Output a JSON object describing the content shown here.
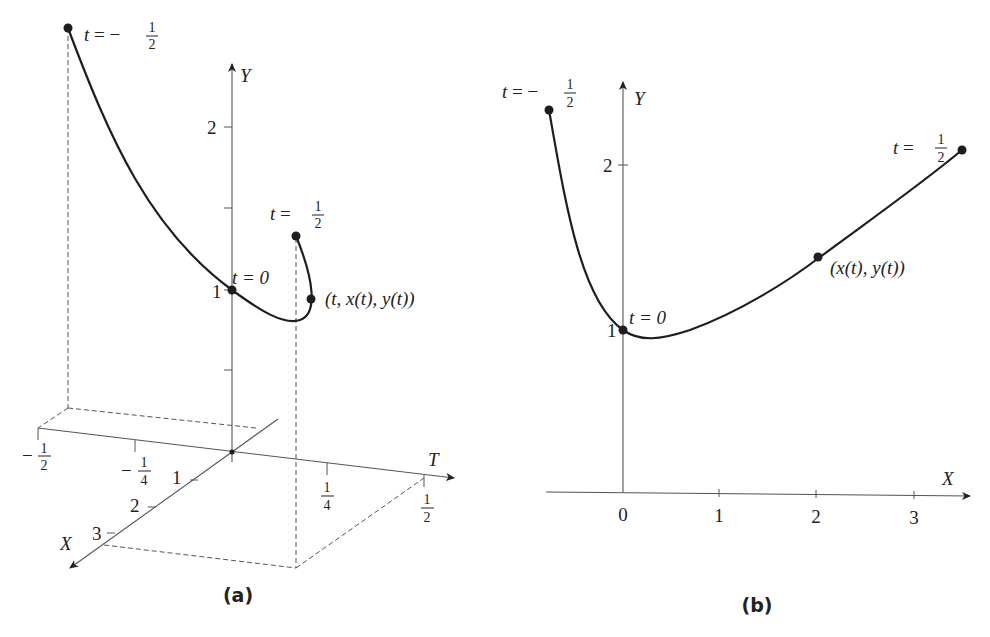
{
  "panel_a": {
    "caption": "(a)",
    "axes": {
      "y_label": "Y",
      "t_label": "T",
      "x_label": "X"
    },
    "y_ticks": [
      "1",
      "2"
    ],
    "t_ticks": [
      {
        "sign": "−",
        "num": "1",
        "den": "2"
      },
      {
        "sign": "−",
        "num": "1",
        "den": "4"
      },
      {
        "sign": "",
        "num": "1",
        "den": "4"
      },
      {
        "sign": "",
        "num": "1",
        "den": "2"
      }
    ],
    "x_ticks": [
      "1",
      "2",
      "3"
    ],
    "labels": {
      "start": {
        "prefix": "t = −",
        "num": "1",
        "den": "2"
      },
      "mid": "t = 0",
      "end": {
        "prefix": "t = ",
        "num": "1",
        "den": "2"
      },
      "point": "(t, x(t), y(t))"
    }
  },
  "panel_b": {
    "caption": "(b)",
    "axes": {
      "y_label": "Y",
      "x_label": "X"
    },
    "y_ticks": [
      "1",
      "2"
    ],
    "x_ticks": [
      "0",
      "1",
      "2",
      "3"
    ],
    "labels": {
      "start": {
        "prefix": "t = −",
        "num": "1",
        "den": "2"
      },
      "mid": "t = 0",
      "end": {
        "prefix": "t = ",
        "num": "1",
        "den": "2"
      },
      "point": "(x(t), y(t))"
    }
  },
  "colors": {
    "curve": "#1e1e1e",
    "axis": "#555555",
    "background": "#ffffff"
  }
}
